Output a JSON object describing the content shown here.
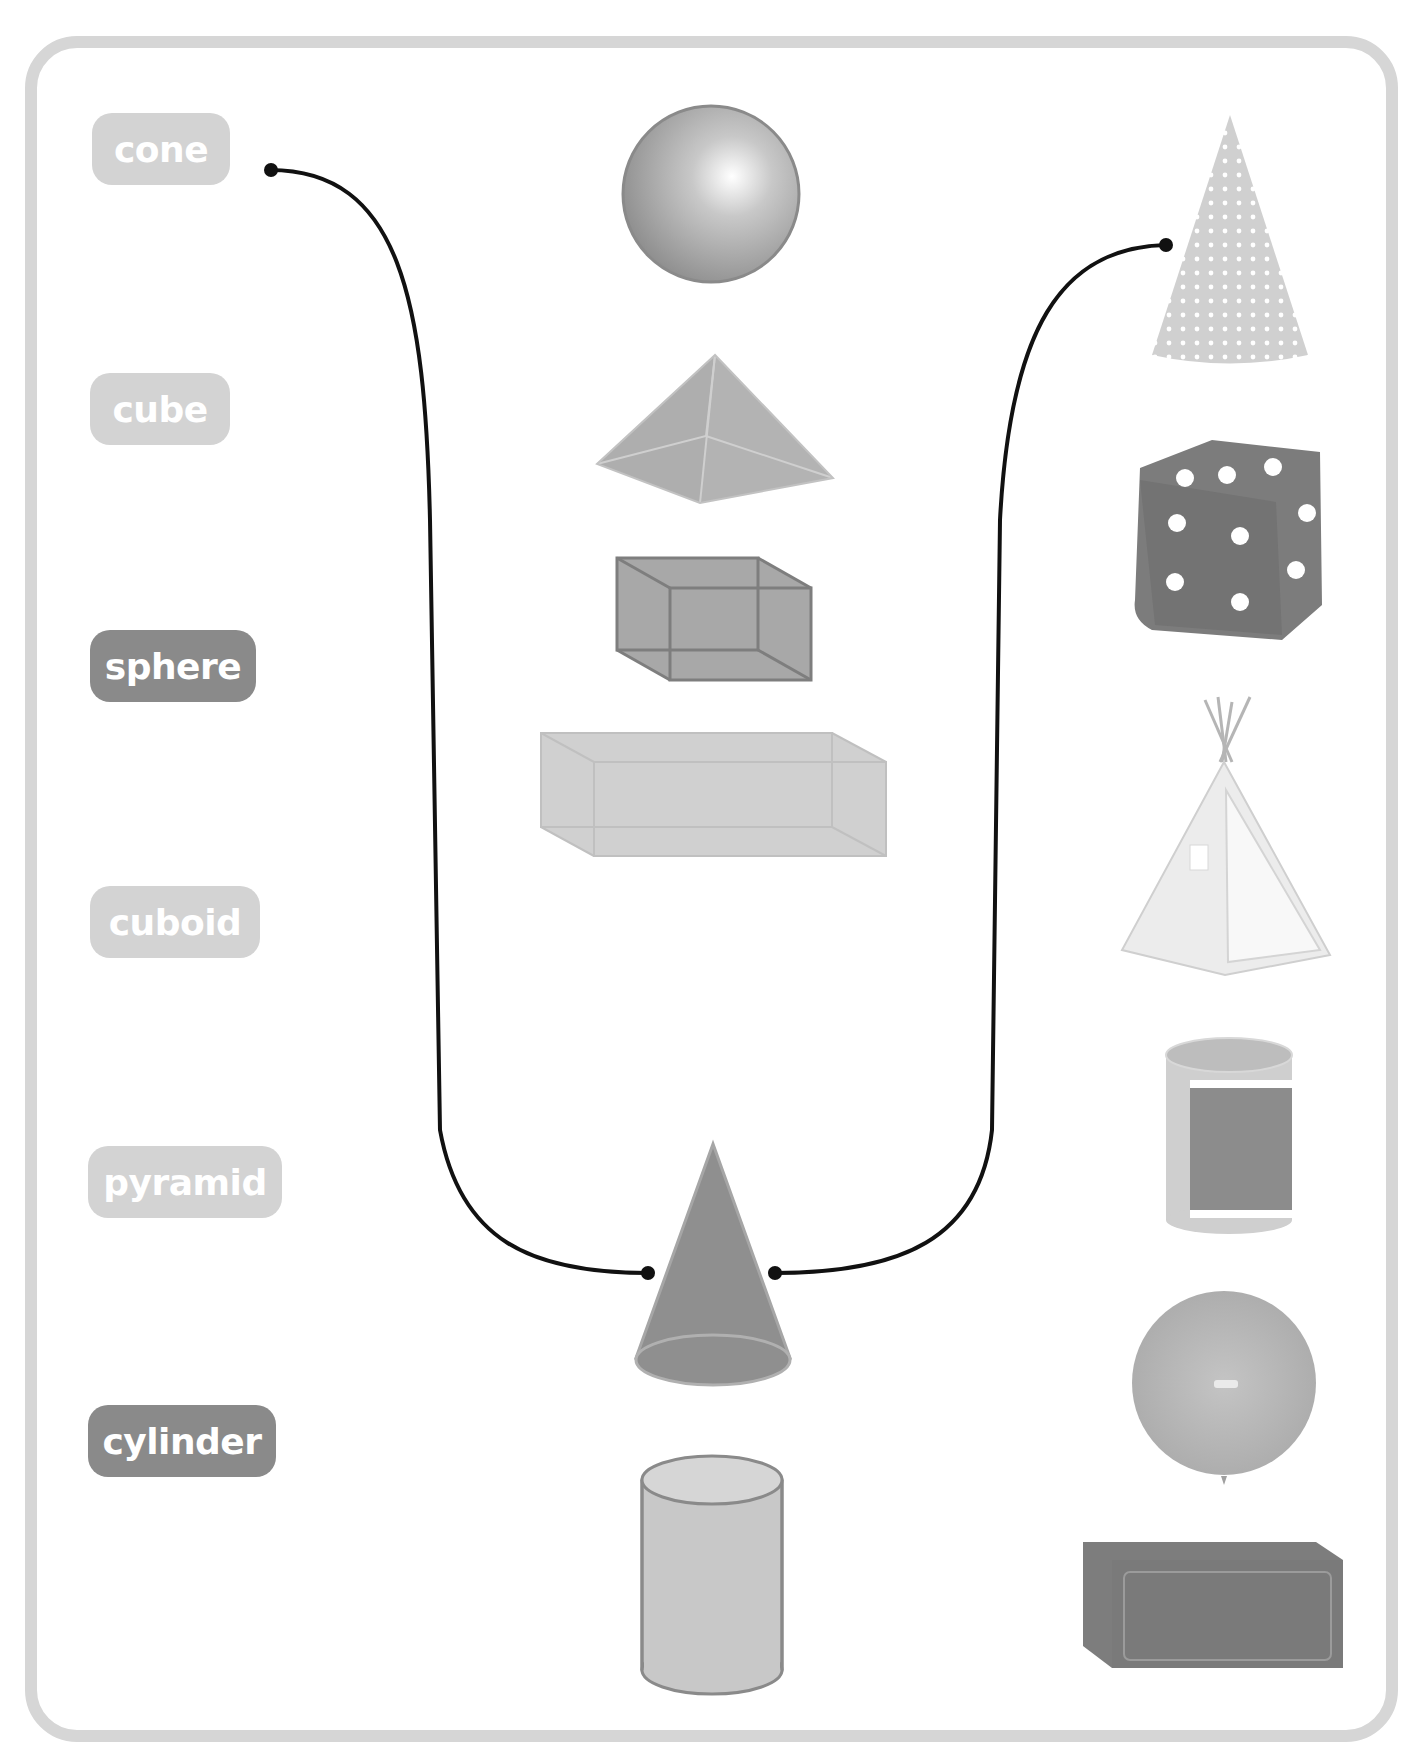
{
  "header": {
    "cut_off_text": ""
  },
  "activity": {
    "type": "match-shapes-to-names-and-objects",
    "labels": [
      {
        "id": "cone",
        "text": "cone",
        "style": "light"
      },
      {
        "id": "cube",
        "text": "cube",
        "style": "light"
      },
      {
        "id": "sphere",
        "text": "sphere",
        "style": "dark"
      },
      {
        "id": "cuboid",
        "text": "cuboid",
        "style": "light"
      },
      {
        "id": "pyramid",
        "text": "pyramid",
        "style": "light"
      },
      {
        "id": "cylinder",
        "text": "cylinder",
        "style": "dark"
      }
    ],
    "center_shapes": [
      "sphere",
      "pyramid",
      "cube",
      "cuboid",
      "cone",
      "cylinder"
    ],
    "right_objects": [
      "party-hat",
      "dice",
      "teepee-tent",
      "paper-roll",
      "balloon",
      "brick"
    ],
    "connections": [
      {
        "from": "label-cone",
        "to": "center-cone"
      },
      {
        "from": "object-party-hat",
        "to": "center-cone"
      }
    ]
  },
  "colors": {
    "frame_border": "#d6d6d6",
    "label_light": "#d3d3d3",
    "label_dark": "#8a8a8a",
    "label_text": "#ffffff",
    "connector": "#111111"
  }
}
